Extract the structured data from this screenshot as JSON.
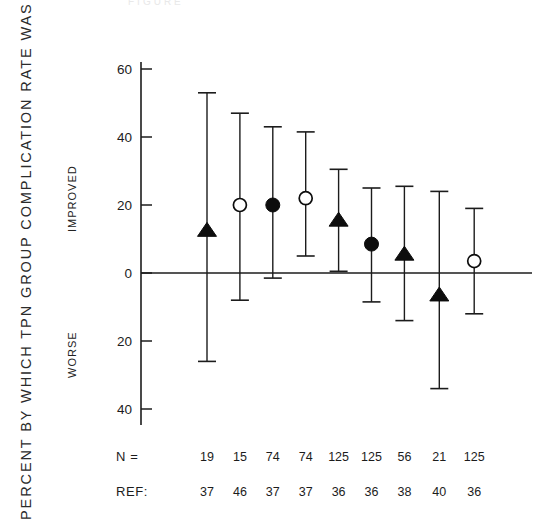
{
  "figure": {
    "top_caption": "FIGURE",
    "axis_title": "PERCENT BY WHICH TPN GROUP COMPLICATION RATE WAS",
    "region_upper": "IMPROVED",
    "region_lower": "WORSE",
    "n_row_label": "N =",
    "ref_row_label": "REF:"
  },
  "chart_data": {
    "type": "scatter",
    "title": "",
    "subtitle": "",
    "xlabel": "",
    "ylabel": "PERCENT BY WHICH TPN GROUP COMPLICATION RATE WAS",
    "ylim": [
      -45,
      65
    ],
    "yticks": [
      60,
      40,
      20,
      0,
      20,
      40
    ],
    "ytick_values": [
      60,
      40,
      20,
      0,
      -20,
      -40
    ],
    "grid": false,
    "legend": null,
    "zero_reference_line": 0,
    "annotations": [
      "IMPROVED",
      "WORSE"
    ],
    "error_bar_style": "capped-vertical",
    "marker_types": [
      "filled-triangle",
      "open-circle",
      "filled-circle",
      "open-circle",
      "filled-triangle",
      "filled-circle",
      "filled-triangle",
      "filled-triangle",
      "open-circle"
    ],
    "points": [
      {
        "index": 1,
        "n": 19,
        "ref": 37,
        "value": 12.5,
        "low": -26.0,
        "high": 53.0,
        "marker": "filled-triangle"
      },
      {
        "index": 2,
        "n": 15,
        "ref": 46,
        "value": 20.0,
        "low": -8.0,
        "high": 47.0,
        "marker": "open-circle"
      },
      {
        "index": 3,
        "n": 74,
        "ref": 37,
        "value": 20.0,
        "low": -1.5,
        "high": 43.0,
        "marker": "filled-circle"
      },
      {
        "index": 4,
        "n": 74,
        "ref": 37,
        "value": 22.0,
        "low": 5.0,
        "high": 41.5,
        "marker": "open-circle"
      },
      {
        "index": 5,
        "n": 125,
        "ref": 36,
        "value": 15.5,
        "low": 0.5,
        "high": 30.5,
        "marker": "filled-triangle"
      },
      {
        "index": 6,
        "n": 125,
        "ref": 36,
        "value": 8.5,
        "low": -8.5,
        "high": 25.0,
        "marker": "filled-circle"
      },
      {
        "index": 7,
        "n": 56,
        "ref": 38,
        "value": 5.5,
        "low": -14.0,
        "high": 25.5,
        "marker": "filled-triangle"
      },
      {
        "index": 8,
        "n": 21,
        "ref": 40,
        "value": -6.5,
        "low": -34.0,
        "high": 24.0,
        "marker": "filled-triangle"
      },
      {
        "index": 9,
        "n": 125,
        "ref": 36,
        "value": 3.5,
        "low": -12.0,
        "high": 19.0,
        "marker": "open-circle"
      }
    ],
    "n_values": [
      19,
      15,
      74,
      74,
      125,
      125,
      56,
      21,
      125
    ],
    "ref_values": [
      37,
      46,
      37,
      37,
      36,
      36,
      38,
      40,
      36
    ]
  },
  "colors": {
    "ink": "#1c1c1c",
    "marker_fill": "#0d0d0d",
    "marker_open": "#ffffff",
    "background": "#ffffff"
  }
}
